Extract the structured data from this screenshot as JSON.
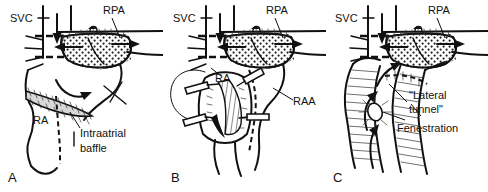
{
  "figure": {
    "background_color": "#ffffff",
    "ink_color": "#111111",
    "baffle_fill_color": "#d8d8d8",
    "rpa_fill_color": "#e2e2e2",
    "panel_count": 3
  },
  "panels": [
    {
      "id": "A",
      "letter": "A",
      "caption": "Superior cavopulmonary anastomosis with intraatrial baffle",
      "labels": [
        {
          "name": "svc",
          "text": "SVC"
        },
        {
          "name": "rpa",
          "text": "RPA"
        },
        {
          "name": "ra",
          "text": "RA"
        },
        {
          "name": "intraatrial-baffle-line1",
          "text": "Intraatrial"
        },
        {
          "name": "intraatrial-baffle-line2",
          "text": "baffle"
        }
      ]
    },
    {
      "id": "B",
      "letter": "B",
      "caption": "Right atrium opened showing right atrial appendage",
      "labels": [
        {
          "name": "svc",
          "text": "SVC"
        },
        {
          "name": "rpa",
          "text": "RPA"
        },
        {
          "name": "ra",
          "text": "RA"
        },
        {
          "name": "raa",
          "text": "RAA"
        }
      ]
    },
    {
      "id": "C",
      "letter": "C",
      "caption": "Completed lateral tunnel with fenestration",
      "labels": [
        {
          "name": "svc",
          "text": "SVC"
        },
        {
          "name": "rpa",
          "text": "RPA"
        },
        {
          "name": "lateral-tunnel-line1",
          "text": "\"Lateral"
        },
        {
          "name": "lateral-tunnel-line2",
          "text": "tunnel\""
        },
        {
          "name": "fenestration",
          "text": "Fenestration"
        }
      ]
    }
  ]
}
